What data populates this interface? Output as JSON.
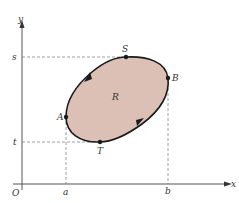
{
  "diagram": {
    "type": "region-in-plane",
    "axes": {
      "x_label": "x",
      "y_label": "y",
      "origin_label": "O"
    },
    "region_label": "R",
    "points": {
      "S": "S",
      "B": "B",
      "A": "A",
      "T": "T"
    },
    "x_ticks": {
      "a": "a",
      "b": "b"
    },
    "y_ticks": {
      "s": "s",
      "t": "t"
    },
    "colors": {
      "region_fill": "#dcc0b6",
      "curve": "#1a1a1a",
      "axis": "#555555",
      "dashed": "#888888"
    }
  }
}
